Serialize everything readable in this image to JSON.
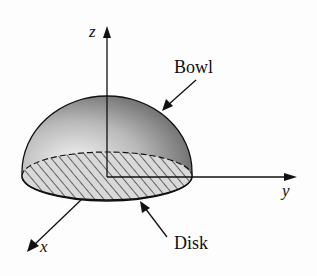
{
  "figure": {
    "axes": {
      "z": "z",
      "y": "y",
      "x": "x"
    },
    "labels": {
      "bowl": "Bowl",
      "disk": "Disk"
    },
    "colors": {
      "ink": "#111111",
      "dome_light": "#e8e8e8",
      "dome_dark": "#555555"
    }
  }
}
